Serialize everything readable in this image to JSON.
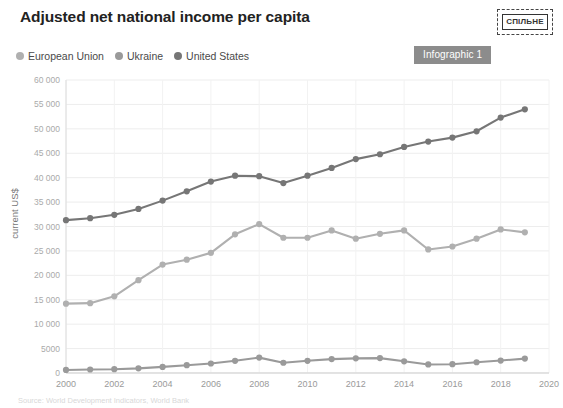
{
  "header": {
    "title": "Adjusted net national income per capita",
    "badge": "Infographic 1",
    "logo_text": "СПІЛЬНЕ"
  },
  "legend": {
    "items": [
      {
        "label": "European Union",
        "color": "#b0b0b0"
      },
      {
        "label": "Ukraine",
        "color": "#9a9a9a"
      },
      {
        "label": "United States",
        "color": "#767676"
      }
    ]
  },
  "footer": {
    "source": "Source: World Development Indicators, World Bank"
  },
  "chart_data": {
    "type": "line",
    "title": "Adjusted net national income per capita",
    "xlabel": "",
    "ylabel": "current US$",
    "ylim": [
      0,
      60000
    ],
    "xlim": [
      2000,
      2020
    ],
    "ytick_labels": [
      "0",
      "5000",
      "10 000",
      "15 000",
      "20 000",
      "25 000",
      "30 000",
      "35 000",
      "40 000",
      "45 000",
      "50 000",
      "55 000",
      "60 000"
    ],
    "ytick_values": [
      0,
      5000,
      10000,
      15000,
      20000,
      25000,
      30000,
      35000,
      40000,
      45000,
      50000,
      55000,
      60000
    ],
    "xtick_labels": [
      "2000",
      "2002",
      "2004",
      "2006",
      "2008",
      "2010",
      "2012",
      "2014",
      "2016",
      "2018",
      "2020"
    ],
    "xtick_values": [
      2000,
      2002,
      2004,
      2006,
      2008,
      2010,
      2012,
      2014,
      2016,
      2018,
      2020
    ],
    "grid": true,
    "legend_position": "top-left",
    "x": [
      2000,
      2001,
      2002,
      2003,
      2004,
      2005,
      2006,
      2007,
      2008,
      2009,
      2010,
      2011,
      2012,
      2013,
      2014,
      2015,
      2016,
      2017,
      2018,
      2019
    ],
    "series": [
      {
        "name": "European Union",
        "color": "#b0b0b0",
        "values": [
          14200,
          14300,
          15700,
          19000,
          22200,
          23200,
          24600,
          28400,
          30500,
          27700,
          27700,
          29200,
          27500,
          28500,
          29200,
          25300,
          25900,
          27500,
          29400,
          28800
        ]
      },
      {
        "name": "Ukraine",
        "color": "#9a9a9a",
        "values": [
          620,
          720,
          780,
          950,
          1250,
          1600,
          1950,
          2500,
          3150,
          2100,
          2500,
          2850,
          3000,
          3050,
          2400,
          1750,
          1800,
          2200,
          2550,
          2950
        ]
      },
      {
        "name": "United States",
        "color": "#767676",
        "values": [
          31300,
          31700,
          32400,
          33600,
          35300,
          37200,
          39200,
          40400,
          40300,
          38900,
          40400,
          42000,
          43800,
          44800,
          46300,
          47400,
          48200,
          49500,
          52300,
          54000
        ]
      }
    ]
  }
}
